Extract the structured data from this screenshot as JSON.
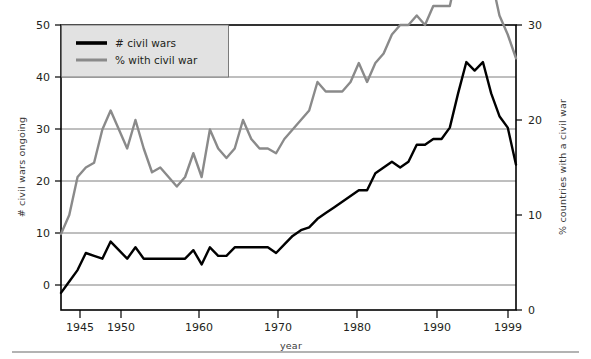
{
  "chart_data": {
    "type": "line",
    "title": "",
    "subtitle": "",
    "xlabel": "year",
    "ylabel": "# civil wars ongoing",
    "y2label": "% countries with a civil war",
    "xlim": [
      1944,
      1999
    ],
    "ylim": [
      0,
      50
    ],
    "y2lim": [
      0,
      30
    ],
    "xticks": [
      1945,
      1950,
      1960,
      1970,
      1980,
      1990,
      1999
    ],
    "xticklabels": [
      "1945",
      "1950",
      "1960",
      "1970",
      "1980",
      "1990",
      "1999"
    ],
    "yticks": [
      0,
      10,
      20,
      30,
      40,
      50
    ],
    "yticklabels": [
      "0",
      "10",
      "20",
      "30",
      "40",
      "50"
    ],
    "y2ticks": [
      0,
      10,
      20,
      30
    ],
    "y2ticklabels": [
      "0",
      "10",
      "20",
      "30"
    ],
    "grid": true,
    "grid_axis": "y",
    "legend_position": "top-left",
    "colors": {
      "civil_wars": "#000000",
      "percent_with_civil_war": "#8a8a8a",
      "legend_background": "#e2e2e2",
      "grid": "#6f6f6f",
      "frame": "#000000"
    },
    "x": [
      1944,
      1945,
      1946,
      1947,
      1948,
      1949,
      1950,
      1951,
      1952,
      1953,
      1954,
      1955,
      1956,
      1957,
      1958,
      1959,
      1960,
      1961,
      1962,
      1963,
      1964,
      1965,
      1966,
      1967,
      1968,
      1969,
      1970,
      1971,
      1972,
      1973,
      1974,
      1975,
      1976,
      1977,
      1978,
      1979,
      1980,
      1981,
      1982,
      1983,
      1984,
      1985,
      1986,
      1987,
      1988,
      1989,
      1990,
      1991,
      1992,
      1993,
      1994,
      1995,
      1996,
      1997,
      1998,
      1999
    ],
    "series": [
      {
        "name": "# civil wars",
        "axis": "left",
        "color": "#000000",
        "values": [
          3,
          5,
          7,
          10,
          9.5,
          9,
          12,
          10.5,
          9,
          11,
          9,
          9,
          9,
          9,
          9,
          9,
          10.5,
          8,
          11,
          9.5,
          9.5,
          11,
          11,
          11,
          11,
          11,
          10,
          11.5,
          13,
          14,
          14.5,
          16,
          17,
          18,
          19,
          20,
          21,
          21,
          24,
          25,
          26,
          25,
          26,
          29,
          29,
          30,
          30,
          32,
          38,
          43.5,
          42,
          43.5,
          38,
          34,
          32,
          25.5
        ]
      },
      {
        "name": "% with civil war",
        "axis": "right",
        "color": "#8a8a8a",
        "values": [
          8,
          10,
          14,
          15,
          15.5,
          19,
          21,
          19,
          17,
          20,
          17,
          14.5,
          15,
          14,
          13,
          14,
          16.5,
          14,
          19,
          17,
          16,
          17,
          20,
          18,
          17,
          17,
          16.5,
          18,
          19,
          20,
          21,
          24,
          23,
          23,
          23,
          24,
          26,
          24,
          26,
          27,
          29,
          30,
          30,
          31,
          30,
          32,
          32,
          32,
          36,
          40,
          38,
          40,
          35,
          31,
          29,
          26.5
        ]
      }
    ]
  },
  "legend": {
    "entries": [
      {
        "label": "# civil wars",
        "swatch": "black-line-swatch"
      },
      {
        "label": "% with civil war",
        "swatch": "gray-line-swatch"
      }
    ]
  }
}
